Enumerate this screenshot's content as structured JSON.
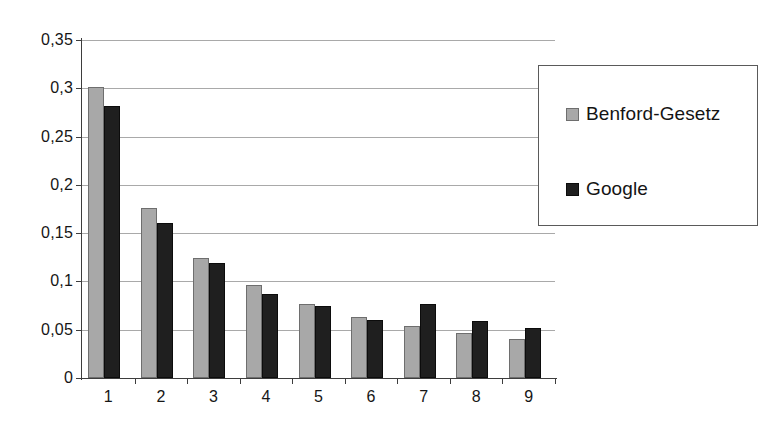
{
  "chart_data": {
    "type": "bar",
    "title": "",
    "subtitle": "",
    "xlabel": "",
    "ylabel": "",
    "categories": [
      "1",
      "2",
      "3",
      "4",
      "5",
      "6",
      "7",
      "8",
      "9"
    ],
    "series": [
      {
        "name": "Benford-Gesetz",
        "color": "#a8a8a8",
        "values": [
          0.301,
          0.176,
          0.124,
          0.096,
          0.077,
          0.063,
          0.054,
          0.047,
          0.04
        ]
      },
      {
        "name": "Google",
        "color": "#1f1f1f",
        "values": [
          0.282,
          0.161,
          0.119,
          0.087,
          0.075,
          0.06,
          0.077,
          0.059,
          0.052
        ]
      }
    ],
    "ylim": [
      0,
      0.35
    ],
    "ytick_values": [
      0,
      0.05,
      0.1,
      0.15,
      0.2,
      0.25,
      0.3,
      0.35
    ],
    "ytick_labels": [
      "0",
      "0,05",
      "0,1",
      "0,15",
      "0,2",
      "0,25",
      "0,3",
      "0,35"
    ],
    "grid": true,
    "grid_axis": "y",
    "legend_position": "right",
    "legend_entries": [
      "Benford-Gesetz",
      "Google"
    ],
    "annotations": [],
    "decimal_separator": ","
  }
}
